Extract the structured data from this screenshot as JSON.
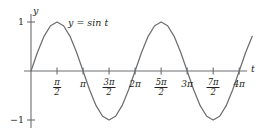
{
  "chart_data": {
    "type": "line",
    "title": "",
    "subtitle": "",
    "xlabel": "t",
    "ylabel": "y",
    "curve_label": "y = sin t",
    "function": "sin",
    "xlim": [
      -0.35,
      13.6
    ],
    "ylim": [
      -1.35,
      1.35
    ],
    "grid": false,
    "legend": "none",
    "annotations": [
      {
        "text": "y = sin t",
        "x": 1.45,
        "y": 1.02
      }
    ],
    "x_ticks": [
      {
        "value": 1.5708,
        "label": "π/2",
        "numerator": "π",
        "denominator": "2",
        "is_fraction": true
      },
      {
        "value": 3.1416,
        "label": "π",
        "numerator": "",
        "denominator": "",
        "is_fraction": false
      },
      {
        "value": 4.7124,
        "label": "3π/2",
        "numerator": "3π",
        "denominator": "2",
        "is_fraction": true
      },
      {
        "value": 6.2832,
        "label": "2π",
        "numerator": "",
        "denominator": "",
        "is_fraction": false
      },
      {
        "value": 7.854,
        "label": "5π/2",
        "numerator": "5π",
        "denominator": "2",
        "is_fraction": true
      },
      {
        "value": 9.4248,
        "label": "3π",
        "numerator": "",
        "denominator": "",
        "is_fraction": false
      },
      {
        "value": 10.9956,
        "label": "7π/2",
        "numerator": "7π",
        "denominator": "2",
        "is_fraction": true
      },
      {
        "value": 12.5664,
        "label": "4π",
        "numerator": "",
        "denominator": "",
        "is_fraction": false
      }
    ],
    "y_ticks": [
      {
        "value": 1,
        "label": "1"
      },
      {
        "value": -1,
        "label": "−1"
      }
    ],
    "x": [
      0,
      0.3927,
      0.7854,
      1.1781,
      1.5708,
      1.9635,
      2.3562,
      2.7489,
      3.1416,
      3.5343,
      3.927,
      4.3197,
      4.7124,
      5.1051,
      5.4978,
      5.8905,
      6.2832,
      6.6759,
      7.0686,
      7.4613,
      7.854,
      8.2467,
      8.6394,
      9.0321,
      9.4248,
      9.8175,
      10.2102,
      10.6029,
      10.9956,
      11.3883,
      11.781,
      12.1737,
      12.5664,
      12.9591,
      13.3518
    ],
    "y": [
      0,
      0.3827,
      0.7071,
      0.9239,
      1,
      0.9239,
      0.7071,
      0.3827,
      0,
      -0.3827,
      -0.7071,
      -0.9239,
      -1,
      -0.9239,
      -0.7071,
      -0.3827,
      0,
      0.3827,
      0.7071,
      0.9239,
      1,
      0.9239,
      0.7071,
      0.3827,
      0,
      -0.3827,
      -0.7071,
      -0.9239,
      -1,
      -0.9239,
      -0.7071,
      -0.3827,
      0,
      0.3827,
      0.7071
    ],
    "colors": {
      "curve": "#6d6e71",
      "axis": "#6d6e71",
      "text": "#231f20"
    }
  }
}
